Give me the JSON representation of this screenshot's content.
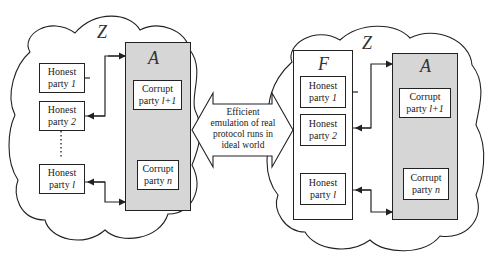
{
  "left_world": {
    "environment_symbol": "Z",
    "adversary_symbol": "A",
    "honest_parties": [
      {
        "label": "Honest",
        "sub_prefix": "party ",
        "sub_index": "1"
      },
      {
        "label": "Honest",
        "sub_prefix": "party ",
        "sub_index": "2"
      },
      {
        "label": "Honest",
        "sub_prefix": "party ",
        "sub_index": "l"
      }
    ],
    "corrupt_parties": [
      {
        "label": "Corrupt",
        "sub_prefix": "party ",
        "sub_index": "l+1"
      },
      {
        "label": "Corrupt",
        "sub_prefix": "party ",
        "sub_index": "n"
      }
    ]
  },
  "center_arrow": {
    "text_lines": [
      "Efficient",
      "emulation of real",
      "protocol runs in",
      "ideal world"
    ]
  },
  "right_world": {
    "environment_symbol": "Z",
    "functionality_symbol": "F",
    "adversary_symbol": "A",
    "honest_parties": [
      {
        "label": "Honest",
        "sub_prefix": "party ",
        "sub_index": "1"
      },
      {
        "label": "Honest",
        "sub_prefix": "party ",
        "sub_index": "2"
      },
      {
        "label": "Honest",
        "sub_prefix": "party ",
        "sub_index": "l"
      }
    ],
    "corrupt_parties": [
      {
        "label": "Corrupt",
        "sub_prefix": "party ",
        "sub_index": "l+1"
      },
      {
        "label": "Corrupt",
        "sub_prefix": "party ",
        "sub_index": "n"
      }
    ]
  },
  "colors": {
    "adversary_fill": "#d6d6d6",
    "stroke": "#222222"
  }
}
